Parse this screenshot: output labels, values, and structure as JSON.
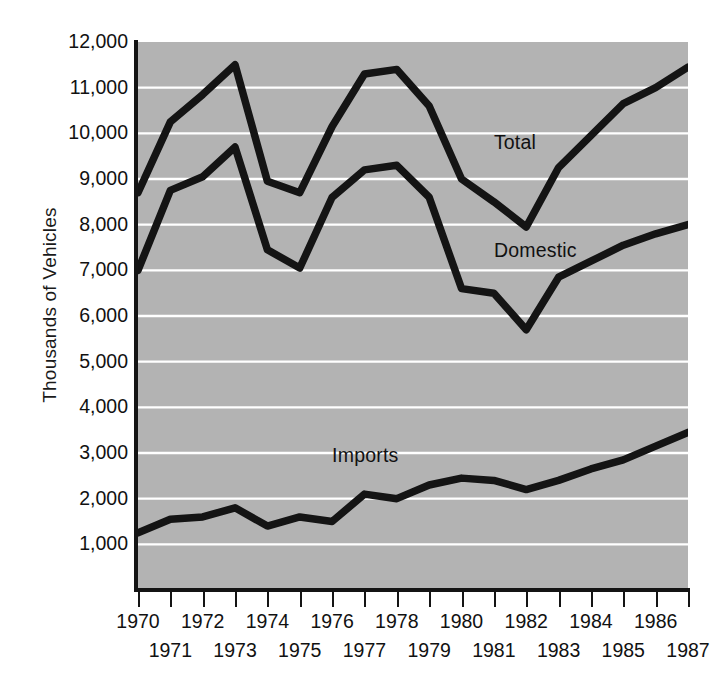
{
  "chart_data": {
    "type": "line",
    "title": "",
    "xlabel": "",
    "ylabel": "Thousands of Vehicles",
    "xlim": [
      1970,
      1987
    ],
    "ylim": [
      0,
      12000
    ],
    "grid": true,
    "grid_axis": "y",
    "legend_position": "inline-annotations",
    "ytick_labels": [
      "12,000",
      "11,000",
      "10,000",
      "9,000",
      "8,000",
      "7,000",
      "6,000",
      "5,000",
      "4,000",
      "3,000",
      "2,000",
      "1,000"
    ],
    "ytick_values": [
      12000,
      11000,
      10000,
      9000,
      8000,
      7000,
      6000,
      5000,
      4000,
      3000,
      2000,
      1000
    ],
    "x": [
      1970,
      1971,
      1972,
      1973,
      1974,
      1975,
      1976,
      1977,
      1978,
      1979,
      1980,
      1981,
      1982,
      1983,
      1984,
      1985,
      1986,
      1987
    ],
    "xtick_labels": [
      "1970",
      "1971",
      "1972",
      "1973",
      "1974",
      "1975",
      "1976",
      "1977",
      "1978",
      "1979",
      "1980",
      "1981",
      "1982",
      "1983",
      "1984",
      "1985",
      "1986",
      "1987"
    ],
    "series": [
      {
        "name": "Total",
        "values": [
          8700,
          10250,
          10850,
          11500,
          8950,
          8700,
          10150,
          11300,
          11400,
          10600,
          9000,
          8500,
          7950,
          9250,
          9950,
          10650,
          11000,
          11450
        ]
      },
      {
        "name": "Domestic",
        "values": [
          7000,
          8750,
          9050,
          9700,
          7450,
          7050,
          8600,
          9200,
          9300,
          8600,
          6600,
          6500,
          5700,
          6850,
          7200,
          7550,
          7800,
          8000
        ]
      },
      {
        "name": "Imports",
        "values": [
          1250,
          1550,
          1600,
          1800,
          1400,
          1600,
          1500,
          2100,
          2000,
          2300,
          2450,
          2400,
          2200,
          2400,
          2650,
          2850,
          3150,
          3450
        ]
      }
    ],
    "annotations": [
      {
        "text": "Total",
        "x": 1981,
        "y": 9800
      },
      {
        "text": "Domestic",
        "x": 1981,
        "y": 7450
      },
      {
        "text": "Imports",
        "x": 1976,
        "y": 2950
      }
    ]
  },
  "axis": {
    "y_title": "Thousands of Vehicles"
  },
  "style": {
    "plot_background": "#b3b3b3",
    "grid_color": "#ffffff",
    "line_color": "#141414",
    "axis_color": "#141414",
    "text_color": "#111111"
  }
}
